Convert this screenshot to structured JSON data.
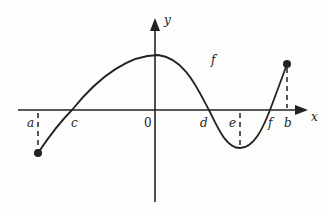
{
  "figure": {
    "axes": {
      "x_label": "x",
      "y_label": "y",
      "origin_label": "0"
    },
    "function_label": "f",
    "points": {
      "a": "a",
      "b": "b",
      "c": "c",
      "d": "d",
      "e": "e",
      "f": "f"
    }
  },
  "colors": {
    "ink": "#222222",
    "background": "#fdfdfb"
  }
}
